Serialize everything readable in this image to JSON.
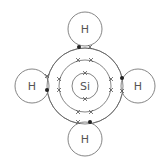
{
  "diagram": {
    "central_atom": {
      "symbol": "Si",
      "x": 85,
      "y": 86,
      "r": 13
    },
    "shells": [
      {
        "name": "second-shell",
        "r": 26
      },
      {
        "name": "outer-shell",
        "r": 38
      }
    ],
    "hydrogens": [
      {
        "symbol": "H",
        "position": "top",
        "x": 85,
        "y": 29,
        "r": 17
      },
      {
        "symbol": "H",
        "position": "left",
        "x": 32,
        "y": 86,
        "r": 17
      },
      {
        "symbol": "H",
        "position": "right",
        "x": 138,
        "y": 86,
        "r": 17
      },
      {
        "symbol": "H",
        "position": "bottom",
        "x": 85,
        "y": 139,
        "r": 17
      }
    ],
    "electron_legend": {
      "silicon": "cross",
      "hydrogen": "dot"
    },
    "colors": {
      "line": "#555555",
      "dot": "#222222"
    }
  }
}
